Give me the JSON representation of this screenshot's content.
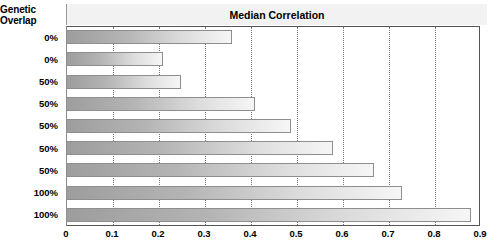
{
  "header": {
    "category_title": "Genetic Overlap",
    "value_title": "Median Correlation"
  },
  "chart_data": {
    "type": "bar",
    "orientation": "horizontal",
    "title": "Median Correlation",
    "xlabel": "",
    "ylabel": "Genetic Overlap",
    "categories": [
      "0%",
      "0%",
      "50%",
      "50%",
      "50%",
      "50%",
      "50%",
      "100%",
      "100%"
    ],
    "values": [
      0.36,
      0.21,
      0.25,
      0.41,
      0.49,
      0.58,
      0.67,
      0.73,
      0.88
    ],
    "xlim": [
      0,
      0.9
    ],
    "xticks": [
      "0",
      "0.1",
      "0.2",
      "0.3",
      "0.4",
      "0.5",
      "0.6",
      "0.7",
      "0.8",
      "0.9"
    ],
    "xtick_values": [
      0,
      0.1,
      0.2,
      0.3,
      0.4,
      0.5,
      0.6,
      0.7,
      0.8,
      0.9
    ],
    "grid": "vertical-dotted",
    "legend": "none",
    "bar_gradient_start": "#9d9d9d",
    "bar_gradient_end": "#f6f6f6",
    "bar_border_color": "#8e8e8e",
    "header_band_color": "#f2f2f2",
    "plot_border_color": "#555555"
  }
}
